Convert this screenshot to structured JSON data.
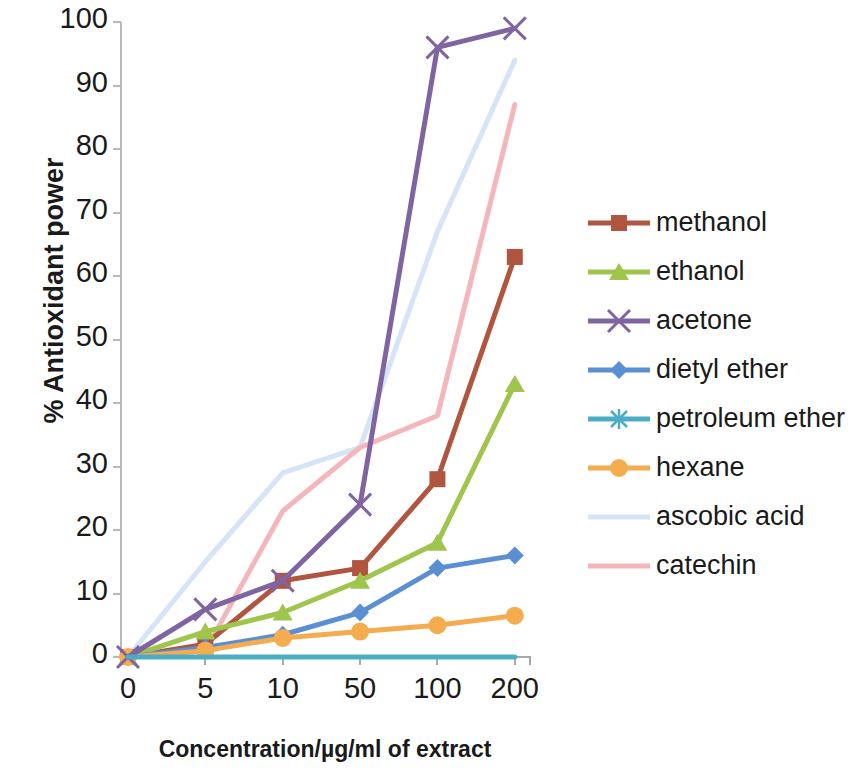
{
  "chart_data": {
    "type": "line",
    "title": "",
    "xlabel": "Concentration/µg/ml of extract",
    "ylabel": "% Antioxidant power",
    "categories": [
      "0",
      "5",
      "10",
      "50",
      "100",
      "200"
    ],
    "ylim": [
      0,
      100
    ],
    "yticks": [
      "0",
      "10",
      "20",
      "30",
      "40",
      "50",
      "60",
      "70",
      "80",
      "90",
      "100"
    ],
    "grid": false,
    "legend_position": "right",
    "series": [
      {
        "name": "methanol",
        "color": "#b0553f",
        "marker": "square",
        "values": [
          0,
          2,
          12,
          14,
          28,
          63
        ]
      },
      {
        "name": "ethanol",
        "color": "#9fc54d",
        "marker": "triangle",
        "values": [
          0,
          4,
          7,
          12,
          18,
          43
        ]
      },
      {
        "name": "acetone",
        "color": "#8064a2",
        "marker": "x",
        "values": [
          0,
          7.5,
          12,
          24,
          96,
          99
        ]
      },
      {
        "name": "dietyl ether",
        "color": "#5b8fd4",
        "marker": "diamond",
        "values": [
          0,
          1.5,
          3.5,
          7,
          14,
          16
        ]
      },
      {
        "name": "petroleum ether",
        "color": "#4bacc6",
        "marker": "asterisk",
        "values": [
          0,
          0,
          0,
          0,
          0,
          0
        ]
      },
      {
        "name": "hexane",
        "color": "#f5ac4e",
        "marker": "circle",
        "values": [
          0,
          1,
          3,
          4,
          5,
          6.5
        ]
      },
      {
        "name": "ascobic acid",
        "color": "#d6e4f7",
        "marker": "none",
        "values": [
          0,
          15,
          29,
          33,
          67,
          94
        ]
      },
      {
        "name": "catechin",
        "color": "#f4b6bb",
        "marker": "none",
        "values": [
          0,
          1,
          23,
          33,
          38,
          87
        ]
      }
    ]
  },
  "axis": {
    "y_title": "% Antioxidant power",
    "x_title": "Concentration/µg/ml of extract"
  },
  "legend": {
    "items": [
      {
        "label": "methanol"
      },
      {
        "label": "ethanol"
      },
      {
        "label": "acetone"
      },
      {
        "label": "dietyl ether"
      },
      {
        "label": "petroleum ether"
      },
      {
        "label": "hexane"
      },
      {
        "label": "ascobic acid"
      },
      {
        "label": "catechin"
      }
    ]
  }
}
